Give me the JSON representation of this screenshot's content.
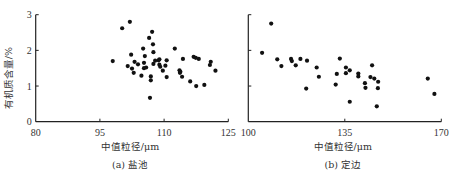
{
  "chart_data": [
    {
      "type": "scatter",
      "caption": "(a) 盐池",
      "xlabel": "中值粒径/μm",
      "ylabel": "有机质含量/%",
      "xlim": [
        80,
        125
      ],
      "ylim": [
        0,
        3
      ],
      "xticks": [
        80,
        95,
        110,
        125
      ],
      "yticks": [
        0,
        1,
        2,
        3
      ],
      "xtick_labels": [
        "80",
        "95",
        "110",
        "125"
      ],
      "ytick_labels": [
        "0",
        "1",
        "2",
        "3"
      ],
      "grid": false,
      "points": [
        [
          98.0,
          1.7
        ],
        [
          100.2,
          2.62
        ],
        [
          102.0,
          2.8
        ],
        [
          101.5,
          1.56
        ],
        [
          102.3,
          1.88
        ],
        [
          102.5,
          1.49
        ],
        [
          102.9,
          1.37
        ],
        [
          103.1,
          1.68
        ],
        [
          103.9,
          1.61
        ],
        [
          104.7,
          1.29
        ],
        [
          105.1,
          2.05
        ],
        [
          105.3,
          1.65
        ],
        [
          105.5,
          1.84
        ],
        [
          105.3,
          1.5
        ],
        [
          105.8,
          1.52
        ],
        [
          106.5,
          2.35
        ],
        [
          106.7,
          0.67
        ],
        [
          106.9,
          1.27
        ],
        [
          106.9,
          1.16
        ],
        [
          107.2,
          2.52
        ],
        [
          107.4,
          2.17
        ],
        [
          107.5,
          1.95
        ],
        [
          107.5,
          1.62
        ],
        [
          107.9,
          1.71
        ],
        [
          108.7,
          1.72
        ],
        [
          108.9,
          1.75
        ],
        [
          108.9,
          1.6
        ],
        [
          109.1,
          1.54
        ],
        [
          109.7,
          1.43
        ],
        [
          110.3,
          1.57
        ],
        [
          110.6,
          1.72
        ],
        [
          110.6,
          1.25
        ],
        [
          112.5,
          2.05
        ],
        [
          113.6,
          1.44
        ],
        [
          113.7,
          1.37
        ],
        [
          113.8,
          1.4
        ],
        [
          114.2,
          1.26
        ],
        [
          114.4,
          1.76
        ],
        [
          116.1,
          1.13
        ],
        [
          116.9,
          1.82
        ],
        [
          117.4,
          1.79
        ],
        [
          117.5,
          1.0
        ],
        [
          118.1,
          1.76
        ],
        [
          119.4,
          1.03
        ],
        [
          120.7,
          1.59
        ],
        [
          120.9,
          1.68
        ],
        [
          122.0,
          1.43
        ]
      ]
    },
    {
      "type": "scatter",
      "caption": "(b) 定边",
      "xlabel": "中值粒径/μm",
      "ylabel": "",
      "xlim": [
        100,
        170
      ],
      "ylim": [
        0,
        3
      ],
      "xticks": [
        100,
        135,
        170
      ],
      "yticks": [
        0,
        1,
        2,
        3
      ],
      "xtick_labels": [
        "100",
        "135",
        "170"
      ],
      "ytick_labels": [],
      "grid": false,
      "points": [
        [
          105.0,
          1.93
        ],
        [
          108.3,
          2.75
        ],
        [
          110.5,
          1.75
        ],
        [
          112.0,
          1.56
        ],
        [
          115.5,
          1.76
        ],
        [
          115.8,
          1.7
        ],
        [
          117.2,
          1.58
        ],
        [
          118.9,
          1.76
        ],
        [
          121.0,
          0.93
        ],
        [
          121.3,
          1.71
        ],
        [
          124.8,
          1.52
        ],
        [
          125.6,
          1.26
        ],
        [
          131.7,
          1.04
        ],
        [
          132.1,
          1.34
        ],
        [
          133.2,
          1.77
        ],
        [
          135.4,
          1.52
        ],
        [
          135.4,
          1.36
        ],
        [
          136.8,
          1.44
        ],
        [
          136.8,
          0.56
        ],
        [
          139.9,
          1.35
        ],
        [
          139.9,
          1.27
        ],
        [
          142.3,
          1.08
        ],
        [
          142.5,
          0.95
        ],
        [
          144.3,
          1.25
        ],
        [
          144.9,
          1.58
        ],
        [
          145.7,
          1.21
        ],
        [
          146.6,
          0.43
        ],
        [
          147.1,
          1.12
        ],
        [
          147.0,
          0.94
        ],
        [
          165.1,
          1.21
        ],
        [
          167.5,
          0.78
        ]
      ]
    }
  ]
}
